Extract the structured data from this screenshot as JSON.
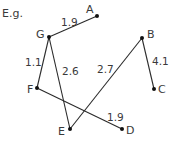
{
  "caption": "E.g.",
  "colors": {
    "edge": "#2a2a2a",
    "node": "#111111",
    "text": "#3a3a3a"
  },
  "nodes": [
    {
      "id": "A",
      "x": 97,
      "y": 16,
      "lx": 86,
      "ly": 13
    },
    {
      "id": "B",
      "x": 142,
      "y": 38,
      "lx": 147,
      "ly": 38
    },
    {
      "id": "C",
      "x": 154,
      "y": 89,
      "lx": 158,
      "ly": 93
    },
    {
      "id": "D",
      "x": 122,
      "y": 129,
      "lx": 126,
      "ly": 134
    },
    {
      "id": "E",
      "x": 70,
      "y": 129,
      "lx": 58,
      "ly": 135
    },
    {
      "id": "F",
      "x": 37,
      "y": 88,
      "lx": 27,
      "ly": 93
    },
    {
      "id": "G",
      "x": 49,
      "y": 37,
      "lx": 36,
      "ly": 38
    }
  ],
  "edges": [
    {
      "from": "G",
      "to": "A",
      "weight": "1.9",
      "lx": 61,
      "ly": 26
    },
    {
      "from": "G",
      "to": "F",
      "weight": "1.1",
      "lx": 25,
      "ly": 66
    },
    {
      "from": "G",
      "to": "E",
      "weight": "2.6",
      "lx": 62,
      "ly": 75
    },
    {
      "from": "B",
      "to": "E",
      "weight": "2.7",
      "lx": 97,
      "ly": 73
    },
    {
      "from": "B",
      "to": "C",
      "weight": "4.1",
      "lx": 152,
      "ly": 65
    },
    {
      "from": "F",
      "to": "D",
      "weight": "1.9",
      "lx": 107,
      "ly": 121
    }
  ]
}
